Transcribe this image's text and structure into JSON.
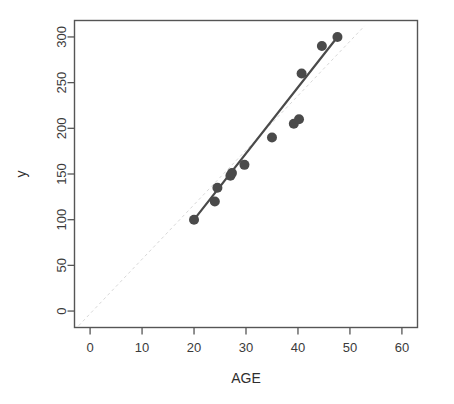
{
  "chart_data": {
    "type": "scatter",
    "title": "",
    "xlabel": "AGE",
    "ylabel": "y",
    "xlim": [
      -3,
      63
    ],
    "ylim": [
      -18,
      318
    ],
    "grid": false,
    "legend": null,
    "x_ticks": [
      0,
      10,
      20,
      30,
      40,
      50,
      60
    ],
    "x_tick_labels": [
      "0",
      "10",
      "20",
      "30",
      "40",
      "50",
      "60"
    ],
    "y_ticks": [
      0,
      50,
      100,
      150,
      200,
      250,
      300
    ],
    "y_tick_labels": [
      "0",
      "50",
      "100",
      "150",
      "200",
      "250",
      "300"
    ],
    "point_color": "#4a4a4a",
    "point_size": 5,
    "series": [
      {
        "name": "observations",
        "marker": "filled-circle",
        "x": [
          20,
          24,
          24.5,
          27,
          27.3,
          29.7,
          35,
          39.2,
          40.2,
          40.7,
          44.6,
          47.6
        ],
        "y": [
          100,
          120,
          135,
          148,
          151,
          160,
          190,
          205,
          210,
          260,
          290,
          300
        ]
      }
    ],
    "lines": [
      {
        "name": "regression-line",
        "style": "solid",
        "color": "#4a4a4a",
        "width": 2.2,
        "x": [
          20,
          47.6
        ],
        "y": [
          100,
          300
        ]
      },
      {
        "name": "reference-line",
        "style": "dashed",
        "color": "#d8d8d8",
        "width": 1,
        "x": [
          -2.2,
          52.8
        ],
        "y": [
          -16,
          312
        ]
      }
    ]
  },
  "axes": {
    "x_axis_label": "AGE",
    "y_axis_label": "y"
  }
}
